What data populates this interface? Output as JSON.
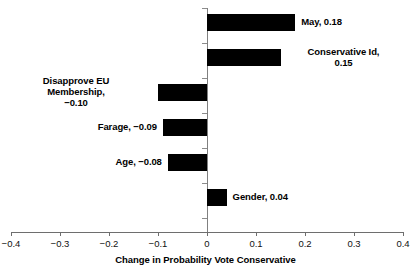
{
  "chart_data": {
    "type": "bar",
    "orientation": "horizontal",
    "title": "",
    "subtitle": "",
    "xlabel": "Change in Probability Vote Conservative",
    "ylabel": "",
    "xlim": [
      -0.4,
      0.4
    ],
    "xticks": [
      "−0.4",
      "−0.3",
      "−0.2",
      "−0.1",
      "0",
      "0.1",
      "0.2",
      "0.3",
      "0.4"
    ],
    "xtick_values": [
      -0.4,
      -0.3,
      -0.2,
      -0.1,
      0,
      0.1,
      0.2,
      0.3,
      0.4
    ],
    "grid": false,
    "legend": false,
    "bar_color": "#000000",
    "axis_color": "#808080",
    "categories": [
      "May",
      "Conservative Id",
      "Disapprove EU Membership",
      "Farage",
      "Age",
      "Gender"
    ],
    "values": [
      0.18,
      0.15,
      -0.1,
      -0.09,
      -0.08,
      0.04
    ],
    "bars": [
      {
        "name": "May",
        "value": 0.18,
        "value_text": "0.18",
        "label": "May, 0.18",
        "label_side": "right",
        "label_align": "left"
      },
      {
        "name": "Conservative Id",
        "value": 0.15,
        "value_text": "0.15",
        "label": "Conservative Id,\n0.15",
        "label_side": "right",
        "label_align": "center"
      },
      {
        "name": "Disapprove EU Membership",
        "value": -0.1,
        "value_text": "−0.10",
        "label": "Disapprove EU\nMembership,\n−0.10",
        "label_side": "left",
        "label_align": "center"
      },
      {
        "name": "Farage",
        "value": -0.09,
        "value_text": "−0.09",
        "label": "Farage, −0.09",
        "label_side": "left",
        "label_align": "right"
      },
      {
        "name": "Age",
        "value": -0.08,
        "value_text": "−0.08",
        "label": "Age, −0.08",
        "label_side": "left",
        "label_align": "right"
      },
      {
        "name": "Gender",
        "value": 0.04,
        "value_text": "0.04",
        "label": "Gender, 0.04",
        "label_side": "right",
        "label_align": "left"
      }
    ]
  }
}
